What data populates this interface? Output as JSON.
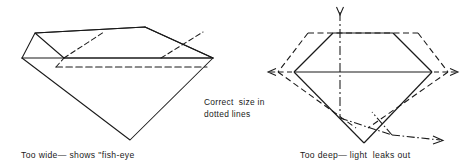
{
  "figure": {
    "type": "line-diagram",
    "background_color": "#ffffff",
    "line_color": "#1a1a1a",
    "panels": [
      {
        "id": "too-wide",
        "caption": "Too wide— shows \"fish-eye",
        "solid_outline_meaning": "incorrect shallow wide cut",
        "dashed_outline_meaning": "correct proportions"
      },
      {
        "id": "too-deep",
        "caption": "Too deep— light  leaks out",
        "solid_outline_meaning": "incorrect deep cut",
        "dashed_outline_meaning": "correct proportions",
        "ray_meaning": "light ray escaping through pavilion"
      }
    ],
    "note_line_1": "Correct  size in",
    "note_line_2": "dotted lines"
  },
  "left_panel": {
    "caption": "Too wide— shows \"fish-eye"
  },
  "center_note": {
    "line1": "Correct  size in",
    "line2": "dotted lines"
  },
  "right_panel": {
    "caption": "Too deep— light  leaks out"
  }
}
